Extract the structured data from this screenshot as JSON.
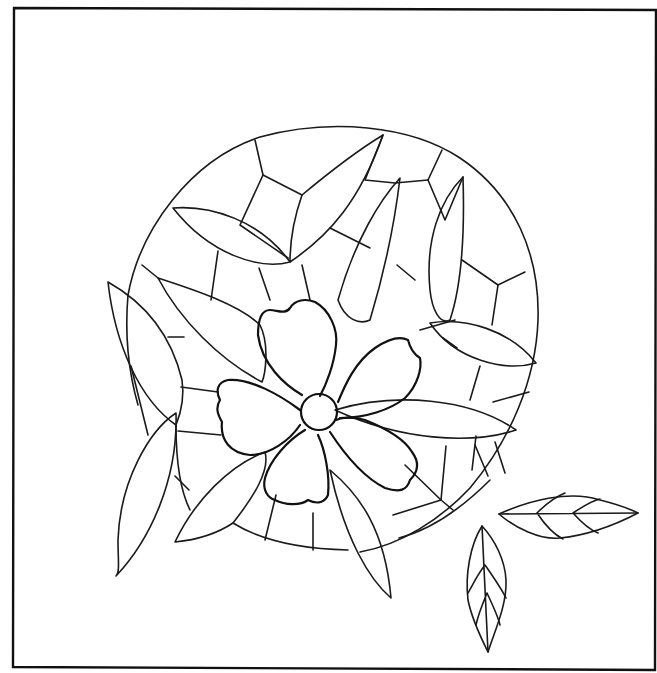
{
  "artwork": {
    "type": "line-art",
    "subject": "stained glass pattern: five-petal flower over a circular leaded-glass medallion with leaves",
    "colors": {
      "line": "#1a1a1a",
      "background": "#ffffff"
    },
    "elements": {
      "frame": "rectangular border",
      "medallion": "circle divided into lead-line segments",
      "flower": {
        "petals": 5,
        "center": "circle"
      },
      "leaves_on_medallion": 11,
      "detached_leaves": 2
    }
  }
}
